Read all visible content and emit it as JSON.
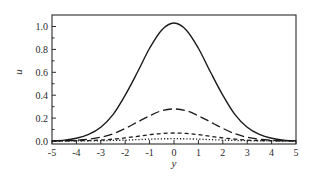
{
  "chart_data": {
    "type": "line",
    "title": "",
    "xlabel": "y",
    "ylabel": "u",
    "xlim": [
      -5,
      5
    ],
    "ylim": [
      0.0,
      1.1
    ],
    "xticks": [
      -5,
      -4,
      -3,
      -2,
      -1,
      0,
      1,
      2,
      3,
      4,
      5
    ],
    "xtick_labels": [
      "-5",
      "-4",
      "-3",
      "-2",
      "-1",
      "0",
      "1",
      "2",
      "3",
      "4",
      "5"
    ],
    "yticks": [
      0.0,
      0.2,
      0.4,
      0.6,
      0.8,
      1.0
    ],
    "ytick_labels": [
      "0.0",
      "0.2",
      "0.4",
      "0.6",
      "0.8",
      "1.0"
    ],
    "grid": false,
    "legend": "none",
    "x": [
      -5,
      -4.5,
      -4,
      -3.5,
      -3,
      -2.5,
      -2,
      -1.5,
      -1,
      -0.5,
      0,
      0.5,
      1,
      1.5,
      2,
      2.5,
      3,
      3.5,
      4,
      4.5,
      5
    ],
    "series": [
      {
        "name": "solid",
        "style": "solid",
        "values": [
          0.003,
          0.008,
          0.024,
          0.057,
          0.12,
          0.23,
          0.4,
          0.6,
          0.81,
          0.97,
          1.03,
          0.97,
          0.81,
          0.6,
          0.4,
          0.23,
          0.12,
          0.057,
          0.024,
          0.008,
          0.003
        ]
      },
      {
        "name": "long-dash",
        "style": "long-dash",
        "values": [
          0.001,
          0.002,
          0.007,
          0.016,
          0.033,
          0.063,
          0.11,
          0.165,
          0.22,
          0.265,
          0.28,
          0.265,
          0.22,
          0.165,
          0.11,
          0.063,
          0.033,
          0.016,
          0.007,
          0.002,
          0.001
        ]
      },
      {
        "name": "short-dash",
        "style": "short-dash",
        "values": [
          0.0,
          0.001,
          0.002,
          0.004,
          0.008,
          0.016,
          0.027,
          0.041,
          0.055,
          0.066,
          0.07,
          0.066,
          0.055,
          0.041,
          0.027,
          0.016,
          0.008,
          0.004,
          0.002,
          0.001,
          0.0
        ]
      },
      {
        "name": "dotted",
        "style": "dotted",
        "values": [
          0.0,
          0.0,
          0.001,
          0.001,
          0.002,
          0.005,
          0.008,
          0.012,
          0.016,
          0.019,
          0.02,
          0.019,
          0.016,
          0.012,
          0.008,
          0.005,
          0.002,
          0.001,
          0.001,
          0.0,
          0.0
        ]
      }
    ]
  },
  "colors": {
    "line": "#1a1a1a",
    "frame": "#2a2a2a",
    "background": "#ffffff"
  }
}
